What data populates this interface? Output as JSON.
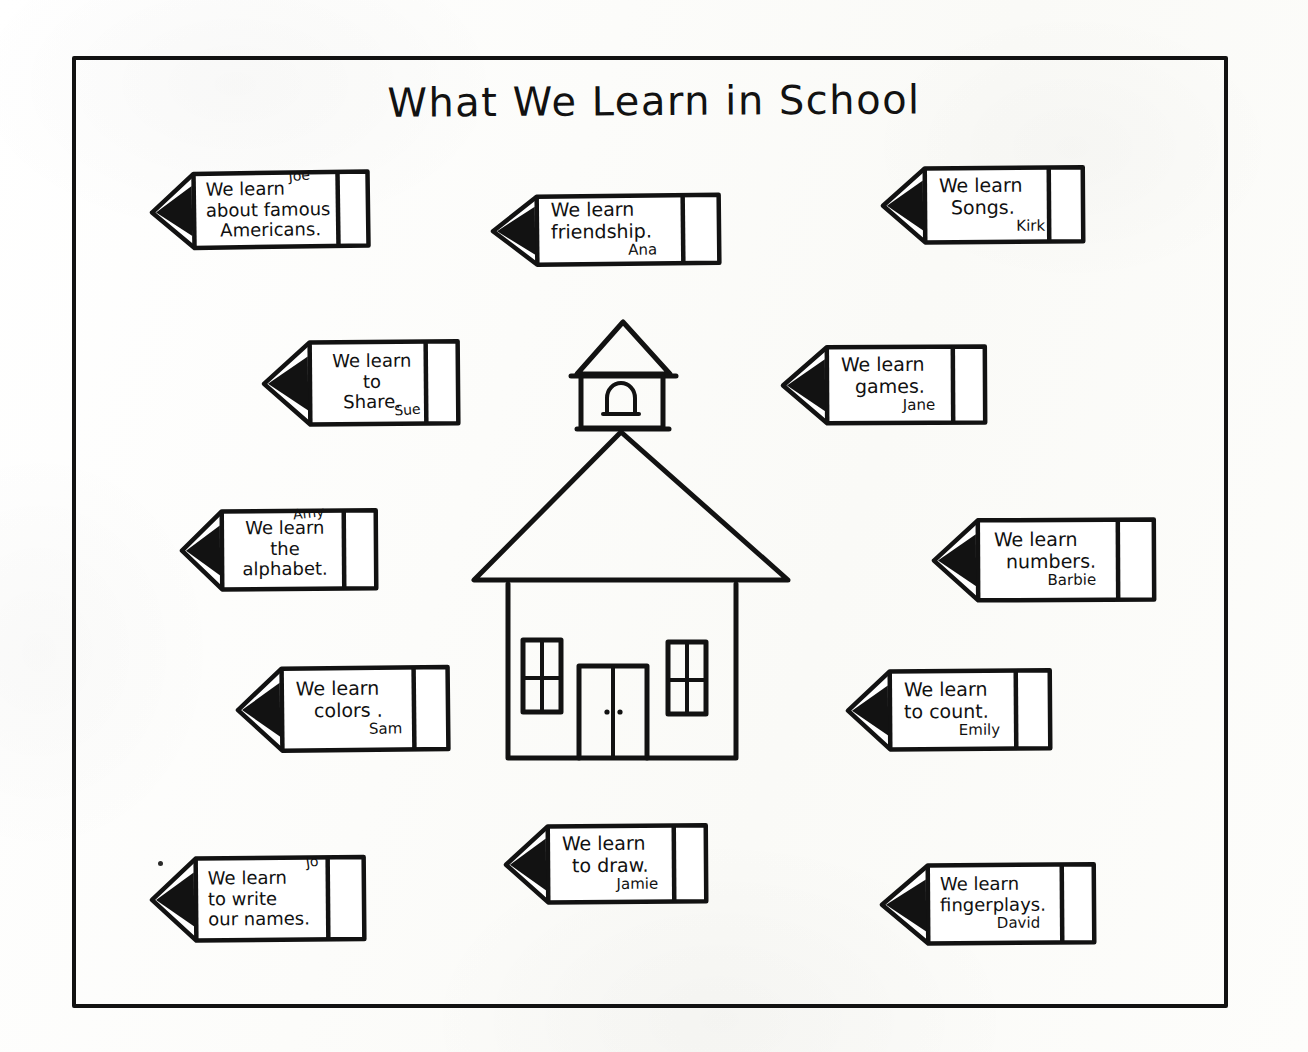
{
  "worksheet": {
    "title": "What We Learn in School",
    "border_color": "#121212",
    "ink_color": "#111111",
    "paper_color": "#fdfdfb",
    "illustration": "one-room-schoolhouse-with-bell-tower"
  },
  "pencils": [
    {
      "id": "famous-americans",
      "lines": [
        "We learn",
        "about famous",
        "Americans."
      ],
      "name": "Joe",
      "name_position": "inline-top-right"
    },
    {
      "id": "friendship",
      "lines": [
        "We learn",
        "friendship."
      ],
      "name": "Ana",
      "name_position": "below-right"
    },
    {
      "id": "songs",
      "lines": [
        "We learn",
        "Songs."
      ],
      "name": "Kirk",
      "name_position": "below-right"
    },
    {
      "id": "share",
      "lines": [
        "We learn",
        "to",
        "Share."
      ],
      "name": "Sue",
      "name_position": "below-right"
    },
    {
      "id": "games",
      "lines": [
        "We learn",
        "games."
      ],
      "name": "Jane",
      "name_position": "below-right"
    },
    {
      "id": "alphabet",
      "lines": [
        "We learn",
        "the",
        "alphabet."
      ],
      "name": "Amy",
      "name_position": "inline-top-right"
    },
    {
      "id": "numbers",
      "lines": [
        "We learn",
        "numbers."
      ],
      "name": "Barbie",
      "name_position": "below-right"
    },
    {
      "id": "colors",
      "lines": [
        "We learn",
        "colors ."
      ],
      "name": "Sam",
      "name_position": "below-right"
    },
    {
      "id": "count",
      "lines": [
        "We learn",
        "to count."
      ],
      "name": "Emily",
      "name_position": "below-right"
    },
    {
      "id": "write-names",
      "lines": [
        "We learn",
        "to write",
        "our names."
      ],
      "name": "Jo",
      "name_position": "inline-top-right"
    },
    {
      "id": "draw",
      "lines": [
        "We learn",
        "to draw."
      ],
      "name": "Jamie",
      "name_position": "below-right"
    },
    {
      "id": "fingerplays",
      "lines": [
        "We learn",
        "fingerplays."
      ],
      "name": "David",
      "name_position": "below-right"
    }
  ]
}
